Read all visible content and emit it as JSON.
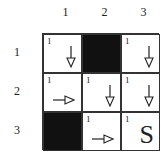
{
  "columns": [
    "1",
    "2",
    "3"
  ],
  "rows": [
    "1",
    "2",
    "3"
  ],
  "cells": [
    [
      {
        "value": "1",
        "blocked": false,
        "icon": "arrow-down"
      },
      {
        "value": "",
        "blocked": true,
        "icon": ""
      },
      {
        "value": "1",
        "blocked": false,
        "icon": "arrow-down"
      }
    ],
    [
      {
        "value": "1",
        "blocked": false,
        "icon": "arrow-right"
      },
      {
        "value": "1",
        "blocked": false,
        "icon": "arrow-down"
      },
      {
        "value": "1",
        "blocked": false,
        "icon": "arrow-down"
      }
    ],
    [
      {
        "value": "",
        "blocked": true,
        "icon": ""
      },
      {
        "value": "1",
        "blocked": false,
        "icon": "arrow-right"
      },
      {
        "value": "1",
        "blocked": false,
        "icon": "start",
        "label": "S"
      }
    ]
  ]
}
